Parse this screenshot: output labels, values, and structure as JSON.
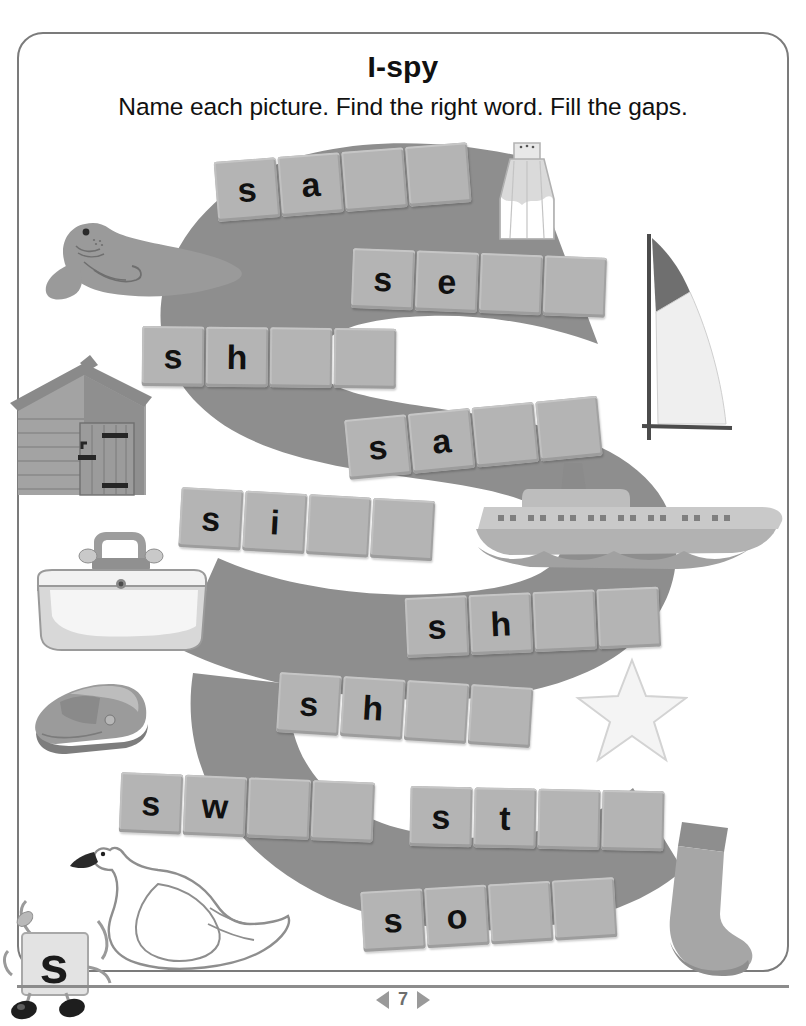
{
  "page": {
    "title": "I-spy",
    "subtitle": "Name each picture. Find the right word. Fill the gaps.",
    "page_number": "7",
    "prev_arrow": "left-triangle",
    "next_arrow": "right-triangle",
    "background_letter": "S",
    "mascot_letter": "s"
  },
  "colors": {
    "border": "#7b7b7b",
    "big_letter": "#8e8e8e",
    "tile_face": "#b4b4b4",
    "tile_text": "#111111",
    "picture_mid": "#9a9a9a",
    "picture_dark": "#6f6f6f",
    "picture_light": "#d4d4d4",
    "footer_text": "#6e6e6e"
  },
  "words": [
    {
      "id": "salt",
      "picture": "salt-shaker",
      "letters": [
        "s",
        "a",
        "",
        ""
      ],
      "slots": 4,
      "filled": 2
    },
    {
      "id": "seal",
      "picture": "seal",
      "letters": [
        "s",
        "e",
        "",
        ""
      ],
      "slots": 4,
      "filled": 2
    },
    {
      "id": "shed",
      "picture": "shed",
      "letters": [
        "s",
        "h",
        "",
        ""
      ],
      "slots": 4,
      "filled": 2
    },
    {
      "id": "sail",
      "picture": "sail",
      "letters": [
        "s",
        "a",
        "",
        ""
      ],
      "slots": 4,
      "filled": 2
    },
    {
      "id": "sink",
      "picture": "sink",
      "letters": [
        "s",
        "i",
        "",
        ""
      ],
      "slots": 4,
      "filled": 2
    },
    {
      "id": "ship",
      "picture": "ship",
      "letters": [
        "s",
        "h",
        "",
        ""
      ],
      "slots": 4,
      "filled": 2
    },
    {
      "id": "shoe",
      "picture": "shoe",
      "letters": [
        "s",
        "h",
        "",
        ""
      ],
      "slots": 4,
      "filled": 2
    },
    {
      "id": "swan",
      "picture": "swan",
      "letters": [
        "s",
        "w",
        "",
        ""
      ],
      "slots": 4,
      "filled": 2
    },
    {
      "id": "star",
      "picture": "star",
      "letters": [
        "s",
        "t",
        "",
        ""
      ],
      "slots": 4,
      "filled": 2
    },
    {
      "id": "sock",
      "picture": "sock",
      "letters": [
        "s",
        "o",
        "",
        ""
      ],
      "slots": 4,
      "filled": 2
    }
  ],
  "pictures": [
    {
      "name": "salt-shaker",
      "label": "salt shaker"
    },
    {
      "name": "seal",
      "label": "seal"
    },
    {
      "name": "shed",
      "label": "shed"
    },
    {
      "name": "sail",
      "label": "sail"
    },
    {
      "name": "sink",
      "label": "sink"
    },
    {
      "name": "ship",
      "label": "ship"
    },
    {
      "name": "shoe",
      "label": "shoe"
    },
    {
      "name": "swan",
      "label": "swan"
    },
    {
      "name": "star",
      "label": "star"
    },
    {
      "name": "sock",
      "label": "sock"
    }
  ]
}
